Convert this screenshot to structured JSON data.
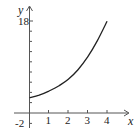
{
  "chart_data": {
    "type": "line",
    "title": "",
    "xlabel": "x",
    "ylabel": "y",
    "x_ticks": [
      1,
      2,
      3,
      4
    ],
    "x_tick_labels": [
      "1",
      "2",
      "3",
      "4"
    ],
    "y_ticks": [
      -2,
      2,
      4,
      6,
      8,
      10,
      12,
      14,
      16,
      18
    ],
    "y_tick_labels_shown": [
      "18",
      "-2"
    ],
    "xlim": [
      -1,
      5
    ],
    "ylim": [
      -3,
      20
    ],
    "grid": false,
    "series": [
      {
        "name": "f(x)",
        "x": [
          0,
          0.5,
          1,
          1.5,
          2,
          2.5,
          3,
          3.5,
          4
        ],
        "y": [
          3,
          3.5,
          4.3,
          5.3,
          6.6,
          8.5,
          11,
          14.2,
          18
        ]
      }
    ],
    "colors": {
      "curve": "#222222",
      "axes": "#555555"
    }
  },
  "labels": {
    "x_axis": "x",
    "y_axis": "y",
    "y_top": "18",
    "y_bottom": "-2",
    "x1": "1",
    "x2": "2",
    "x3": "3",
    "x4": "4"
  }
}
